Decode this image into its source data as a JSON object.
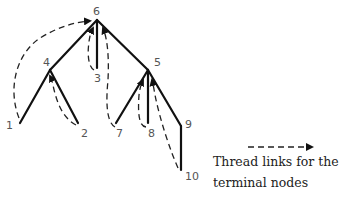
{
  "diagram": {
    "nodes": [
      {
        "id": "6",
        "label": "6",
        "x": 97,
        "y": 20,
        "lx": 93,
        "ly": 15
      },
      {
        "id": "4",
        "label": "4",
        "x": 50,
        "y": 70,
        "lx": 43,
        "ly": 66
      },
      {
        "id": "5",
        "label": "5",
        "x": 148,
        "y": 70,
        "lx": 154,
        "ly": 66
      },
      {
        "id": "3",
        "label": "3",
        "x": 97,
        "y": 68,
        "lx": 94,
        "ly": 82
      },
      {
        "id": "1",
        "label": "1",
        "x": 20,
        "y": 123,
        "lx": 6,
        "ly": 129
      },
      {
        "id": "2",
        "label": "2",
        "x": 78,
        "y": 123,
        "lx": 81,
        "ly": 137
      },
      {
        "id": "7",
        "label": "7",
        "x": 116,
        "y": 123,
        "lx": 116,
        "ly": 137
      },
      {
        "id": "8",
        "label": "8",
        "x": 148,
        "y": 123,
        "lx": 148,
        "ly": 137
      },
      {
        "id": "9",
        "label": "9",
        "x": 181,
        "y": 126,
        "lx": 185,
        "ly": 128
      },
      {
        "id": "10",
        "label": "10",
        "x": 181,
        "y": 170,
        "lx": 185,
        "ly": 180
      }
    ],
    "edges": [
      [
        "6",
        "4"
      ],
      [
        "6",
        "3"
      ],
      [
        "6",
        "5"
      ],
      [
        "4",
        "1"
      ],
      [
        "4",
        "2"
      ],
      [
        "5",
        "7"
      ],
      [
        "5",
        "8"
      ],
      [
        "5",
        "9"
      ],
      [
        "9",
        "10"
      ]
    ],
    "thread_links": [
      {
        "from": "1",
        "to": "6"
      },
      {
        "from": "2",
        "to": "4"
      },
      {
        "from": "3",
        "to": "6"
      },
      {
        "from": "7",
        "to": "6"
      },
      {
        "from": "8",
        "to": "5"
      },
      {
        "from": "10",
        "to": "5"
      }
    ]
  },
  "legend": {
    "line1": "Thread links for the",
    "line2": "terminal nodes",
    "symbol": "dashed-arrow"
  }
}
